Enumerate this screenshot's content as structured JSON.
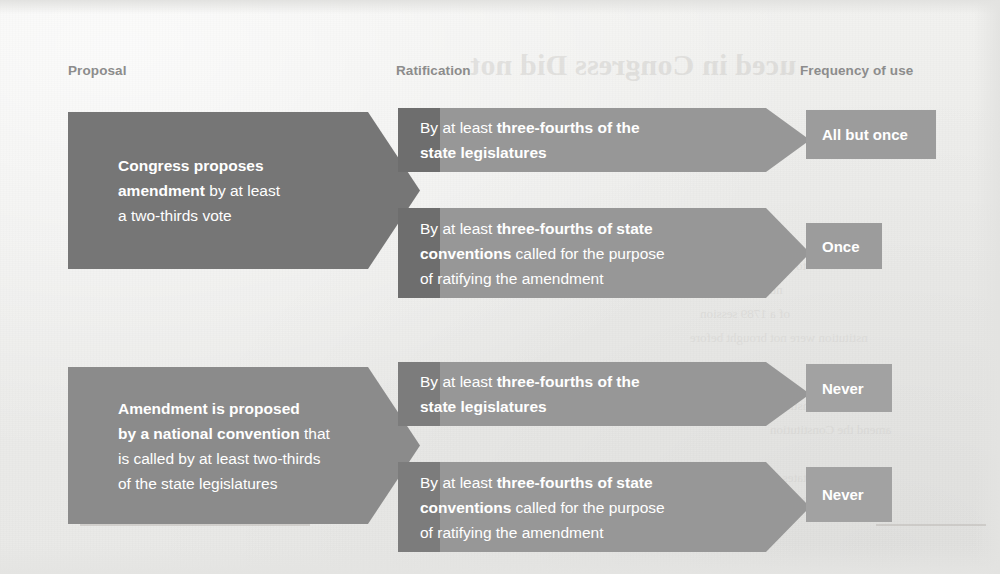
{
  "headers": {
    "proposal": "Proposal",
    "ratification": "Ratification",
    "frequency": "Frequency of use"
  },
  "bleed_through": {
    "title": "uced in Congress Did not",
    "lines": [
      "to be included in the",
      "ntion, allowed for",
      "of a 1789 session",
      "nstitution were not brought before",
      "ve to the Constitution",
      "amend the Constitution",
      "only the states that",
      "required for ratification"
    ]
  },
  "rows": [
    {
      "proposal": {
        "bold_lead": "Congress proposes amendment",
        "rest": " by at least a two-thirds vote",
        "html": "<b>Congress proposes<br>amendment</b> by at least<br>a two-thirds vote"
      },
      "ratifications": [
        {
          "html": "By at least <b>three-fourths of the<br>state legislatures</b>",
          "plain": "By at least three-fourths of the state legislatures",
          "frequency": "All but once"
        },
        {
          "html": "By at least <b>three-fourths of state<br>conventions</b> called for the purpose<br>of ratifying the amendment",
          "plain": "By at least three-fourths of state conventions called for the purpose of ratifying the amendment",
          "frequency": "Once"
        }
      ]
    },
    {
      "proposal": {
        "bold_lead": "Amendment is proposed by a national convention",
        "rest": " that is called by at least two-thirds of the state legislatures",
        "html": "<b>Amendment is proposed<br>by a national convention</b> that<br>is called by at least two-thirds<br>of the state legislatures"
      },
      "ratifications": [
        {
          "html": "By at least <b>three-fourths of the<br>state legislatures</b>",
          "plain": "By at least three-fourths of the state legislatures",
          "frequency": "Never"
        },
        {
          "html": "By at least <b>three-fourths of state<br>conventions</b> called for the purpose<br>of ratifying the amendment",
          "plain": "By at least three-fourths of state conventions called for the purpose of ratifying the amendment",
          "frequency": "Never"
        }
      ]
    }
  ],
  "colors": {
    "page_background": "#ececea",
    "header_text": "#8c8c8c",
    "proposal_row1": "#767676",
    "proposal_row2": "#8b8b8b",
    "ratification_band": "#979797",
    "ratification_overlap": "#6e6e6e",
    "frequency_badge": "#9c9c9c",
    "body_text": "#ffffff"
  }
}
